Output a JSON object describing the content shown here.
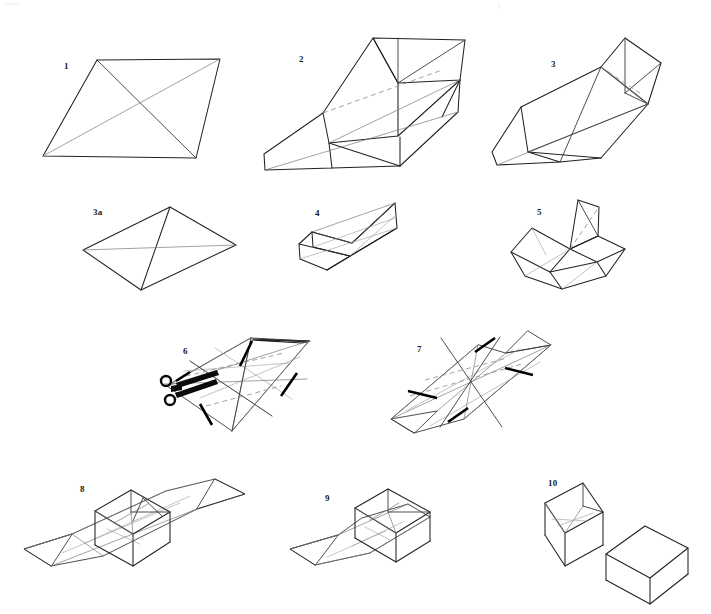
{
  "page": {
    "background_color": "#ffffff",
    "width": 711,
    "height": 614,
    "ink_color": "#3a3a3a",
    "cut_color": "#000000",
    "fold_hint_color": "#8c8c8c"
  },
  "figures": [
    {
      "id": "fig-1",
      "label": "1",
      "label_x": 64,
      "label_y": 62,
      "caption": "Flat parallelogram sheet with both diagonals creased"
    },
    {
      "id": "fig-2",
      "label": "2",
      "label_x": 299,
      "label_y": 55,
      "caption": "Sheet folded along diagonal, one triangular flap raised, dashed hidden fold"
    },
    {
      "id": "fig-3",
      "label": "3",
      "label_x": 551,
      "label_y": 60,
      "caption": "Both end flaps raised to form a prism shape"
    },
    {
      "id": "fig-3a",
      "label": "3a",
      "label_x": 93,
      "label_y": 208,
      "caption": "Alternate flat rhombus with both diagonals creased"
    },
    {
      "id": "fig-4",
      "label": "4",
      "label_x": 315,
      "label_y": 209,
      "caption": "Trough form created by folding the long sides upward"
    },
    {
      "id": "fig-5",
      "label": "5",
      "label_x": 537,
      "label_y": 208,
      "caption": "Corner pinched upward making a standing triangular fin"
    },
    {
      "id": "fig-6",
      "label": "6",
      "label_x": 183,
      "label_y": 347,
      "caption": "Unfolded sheet showing crease grid with heavy cut lines; cut with scissors"
    },
    {
      "id": "fig-7",
      "label": "7",
      "label_x": 417,
      "label_y": 345,
      "caption": "Sheet after cutting, pointed ends with freed flaps"
    },
    {
      "id": "fig-8",
      "label": "8",
      "label_x": 80,
      "label_y": 485,
      "caption": "Long form with the central box walls folded up"
    },
    {
      "id": "fig-9",
      "label": "9",
      "label_x": 325,
      "label_y": 494,
      "caption": "Pointed tail tucked, open box formed at one end"
    },
    {
      "id": "fig-10",
      "label": "10",
      "label_x": 548,
      "label_y": 479,
      "caption": "Completed open box and matching closed lid"
    }
  ],
  "tools": [
    {
      "id": "scissors",
      "icon": "scissors-icon",
      "x": 178,
      "y": 388,
      "caption": "Scissors marking where to cut in figure 6"
    }
  ]
}
